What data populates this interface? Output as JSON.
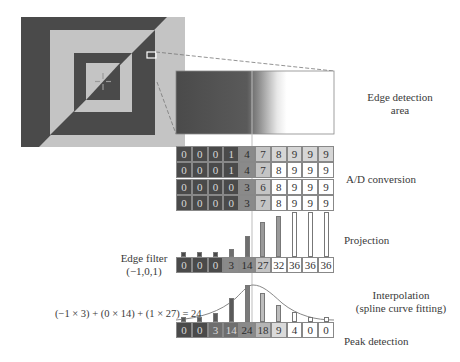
{
  "labels": {
    "edge_detection_area": [
      "Edge detection",
      "area"
    ],
    "ad_conversion": "A/D conversion",
    "projection": "Projection",
    "edge_filter": [
      "Edge filter",
      "(−1,0,1)"
    ],
    "interpolation": [
      "Interpolation",
      "(spline curve fitting)"
    ],
    "peak_detection": "Peak detection",
    "formula": "(−1 × 3) + (0 × 14) + (1 × 27) = 24"
  },
  "ad_grid": [
    [
      0,
      0,
      0,
      1,
      4,
      7,
      8,
      9,
      9,
      9
    ],
    [
      0,
      0,
      0,
      1,
      4,
      7,
      8,
      9,
      9,
      9
    ],
    [
      0,
      0,
      0,
      0,
      3,
      6,
      8,
      9,
      9,
      9
    ],
    [
      0,
      0,
      0,
      0,
      3,
      7,
      8,
      9,
      9,
      9
    ]
  ],
  "projection_values": [
    0,
    0,
    0,
    3,
    14,
    27,
    32,
    36,
    36,
    36
  ],
  "peak_values": [
    0,
    0,
    3,
    14,
    24,
    18,
    9,
    4,
    0,
    0
  ],
  "colors": {
    "dark": "#4a4a4a",
    "mid": "#8a8a8a",
    "light": "#c4c4c4",
    "white": "#ffffff"
  }
}
